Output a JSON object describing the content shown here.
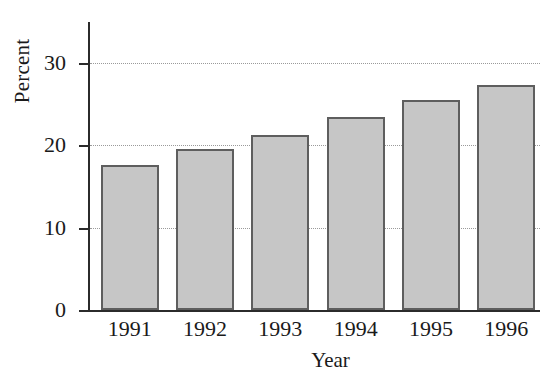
{
  "chart_data": {
    "type": "bar",
    "title": "",
    "xlabel": "Year",
    "ylabel": "Percent",
    "categories": [
      "1991",
      "1992",
      "1993",
      "1994",
      "1995",
      "1996"
    ],
    "values": [
      17.6,
      19.6,
      21.3,
      23.5,
      25.5,
      27.4
    ],
    "ylim": [
      0,
      35
    ],
    "yticks": [
      0,
      10,
      20,
      30
    ],
    "ytick_labels": [
      "0",
      "10",
      "20",
      "30"
    ],
    "gridlines": [
      10,
      20,
      30
    ],
    "grid": true,
    "grid_style": "dotted",
    "legend": null,
    "legend_position": "none",
    "bar_fill_color": "#c6c6c6",
    "bar_edge_color": "#5e5e5e",
    "axis_color": "#2b2b2b",
    "grid_color": "#9a9a9a",
    "background_color": "#ffffff",
    "text_color": "#1a1a1a"
  }
}
